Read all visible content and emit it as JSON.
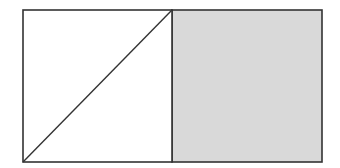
{
  "diagram": {
    "colors": {
      "stroke": "#333333",
      "shaded_fill": "#d9d9d9",
      "background": "#ffffff"
    },
    "shapes": {
      "left_square": {
        "x": 23,
        "y": 10,
        "w": 149,
        "h": 152
      },
      "right_square": {
        "x": 172,
        "y": 10,
        "w": 150,
        "h": 152
      },
      "diagonal": {
        "x1": 23,
        "y1": 162,
        "x2": 172,
        "y2": 10
      }
    }
  }
}
